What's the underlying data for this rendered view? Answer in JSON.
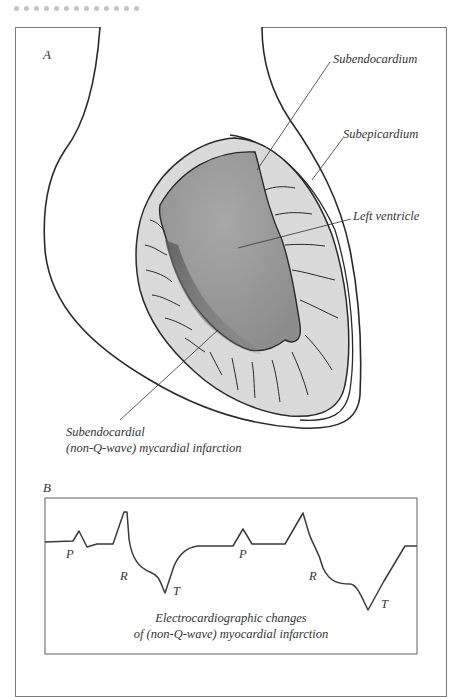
{
  "header": {
    "dot_count": 13,
    "dot_color": "#c4c4c4"
  },
  "panel_a": {
    "label": "A",
    "callouts": {
      "subendocardium": "Subendocardium",
      "subepicardium": "Subepicardium",
      "left_ventricle": "Left ventricle",
      "infarction_line1": "Subendocardial",
      "infarction_line2": "(non-Q-wave) mycardial infarction"
    },
    "colors": {
      "outline": "#2a2a2a",
      "myocardium": "#d9d9d9",
      "cavity": "#9a9a9a",
      "infarct_shadow": "#6e6e6e"
    }
  },
  "panel_b": {
    "label": "B",
    "waves": [
      {
        "name": "P",
        "text": "P"
      },
      {
        "name": "R",
        "text": "R"
      },
      {
        "name": "T",
        "text": "T"
      },
      {
        "name": "P",
        "text": "P"
      },
      {
        "name": "R",
        "text": "R"
      },
      {
        "name": "T",
        "text": "T"
      }
    ],
    "caption_line1": "Electrocardiographic changes",
    "caption_line2": "of (non-Q-wave) myocardial infarction"
  }
}
